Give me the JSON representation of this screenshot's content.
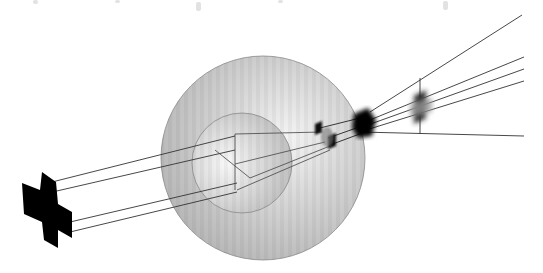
{
  "diagram": {
    "type": "optical-ray-diagram",
    "background": "#ffffff",
    "outer_sphere": {
      "cx": 263,
      "cy": 158,
      "r": 102,
      "fill": "#c8c8c8",
      "stroke": "#8a8a8a"
    },
    "inner_sphere": {
      "cx": 242,
      "cy": 163,
      "r": 50,
      "fill": "#d8d8d8",
      "stroke": "#8a8a8a"
    },
    "object": {
      "label": "",
      "color": "#000000"
    },
    "images": [
      {
        "x": 327,
        "y": 133,
        "color": "#111111",
        "blur": 1.5
      },
      {
        "x": 364,
        "y": 123,
        "color": "#000000",
        "blur": 2
      },
      {
        "x": 420,
        "y": 106,
        "color": "#555555",
        "blur": 2.5
      }
    ],
    "ray_color": "#222222",
    "guide_color": "#555555",
    "faint_marks": [
      {
        "x": 35,
        "y": 0
      },
      {
        "x": 117,
        "y": 0
      },
      {
        "x": 198,
        "y": 6
      },
      {
        "x": 280,
        "y": 0
      },
      {
        "x": 445,
        "y": 6
      }
    ]
  }
}
